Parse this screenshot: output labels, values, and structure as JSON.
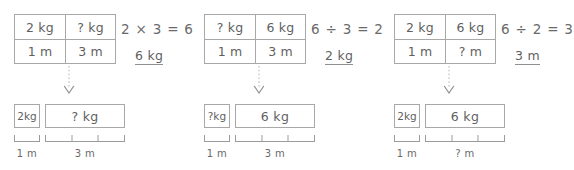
{
  "worksheet": {
    "title": "Proportional reasoning bar-model worksheet",
    "ink_color": "#6b6b6b",
    "line_color": "#a8a8a8",
    "panels": [
      {
        "id": "panel-0",
        "table": {
          "top_left": "2 kg",
          "top_right": "? kg",
          "bottom_left": "1 m",
          "bottom_right": "3 m"
        },
        "equation": "2 × 3 = 6",
        "answer": "6 kg",
        "bar_small_label": "2kg",
        "bar_large_label": "? kg",
        "ruler_small_label": "1 m",
        "ruler_large_label": "3 m",
        "ruler_small_segments": 1,
        "ruler_large_segments": 3
      },
      {
        "id": "panel-1",
        "table": {
          "top_left": "? kg",
          "top_right": "6 kg",
          "bottom_left": "1 m",
          "bottom_right": "3 m"
        },
        "equation": "6 ÷ 3 = 2",
        "answer": "2 kg",
        "bar_small_label": "?kg",
        "bar_large_label": "6 kg",
        "ruler_small_label": "1 m",
        "ruler_large_label": "3 m",
        "ruler_small_segments": 1,
        "ruler_large_segments": 3
      },
      {
        "id": "panel-2",
        "table": {
          "top_left": "2 kg",
          "top_right": "6 kg",
          "bottom_left": "1 m",
          "bottom_right": "? m"
        },
        "equation": "6 ÷ 2 = 3",
        "answer": "3 m",
        "bar_small_label": "2kg",
        "bar_large_label": "6 kg",
        "ruler_small_label": "1 m",
        "ruler_large_label": "? m",
        "ruler_small_segments": 1,
        "ruler_large_segments": 3
      }
    ]
  }
}
